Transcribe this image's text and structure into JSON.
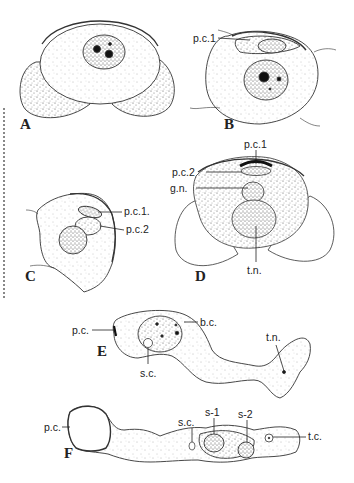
{
  "figure": {
    "panels": [
      {
        "id": "A",
        "label": "A",
        "annotations": []
      },
      {
        "id": "B",
        "label": "B",
        "annotations": [
          "p.c.1"
        ]
      },
      {
        "id": "C",
        "label": "C",
        "annotations": [
          "p.c.1.",
          "p.c.2"
        ]
      },
      {
        "id": "D",
        "label": "D",
        "annotations": [
          "p.c.1",
          "p.c.2",
          "g.n.",
          "t.n."
        ]
      },
      {
        "id": "E",
        "label": "E",
        "annotations": [
          "p.c.",
          "b.c.",
          "s.c.",
          "t.n."
        ]
      },
      {
        "id": "F",
        "label": "F",
        "annotations": [
          "p.c.",
          "s.c.",
          "s-1",
          "s-2",
          "t.c."
        ]
      }
    ],
    "labels": {
      "A": "A",
      "B": "B",
      "C": "C",
      "D": "D",
      "E": "E",
      "F": "F",
      "B_pc1": "p.c.1",
      "C_pc1": "p.c.1.",
      "C_pc2": "p.c.2",
      "D_pc1": "p.c.1",
      "D_pc2": "p.c.2",
      "D_gn": "g.n.",
      "D_tn": "t.n.",
      "E_pc": "p.c.",
      "E_bc": "b.c.",
      "E_sc": "s.c.",
      "E_tn": "t.n.",
      "F_pc": "p.c.",
      "F_sc": "s.c.",
      "F_s1": "s-1",
      "F_s2": "s-2",
      "F_tc": "t.c."
    }
  },
  "colors": {
    "ink": "#222222",
    "background": "#ffffff"
  }
}
